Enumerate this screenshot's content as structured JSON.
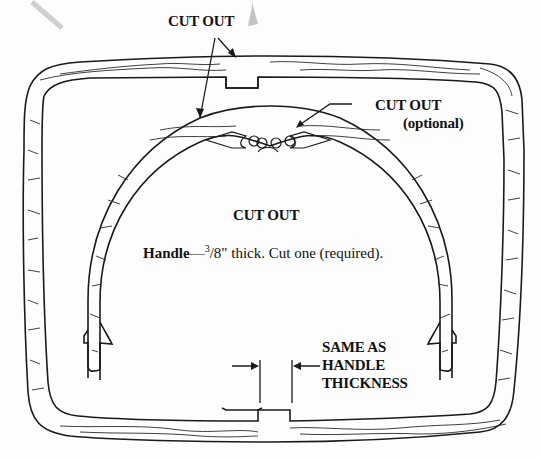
{
  "diagram": {
    "type": "woodworking-pattern",
    "labels": {
      "cutout_top": "CUT OUT",
      "cutout_optional_line1": "CUT OUT",
      "cutout_optional_line2": "(optional)",
      "cutout_center": "CUT OUT",
      "handle_name": "Handle",
      "handle_dash": "—",
      "handle_frac_num": "3",
      "handle_frac_den": "/8\"",
      "handle_desc": " thick. Cut one (required).",
      "same_as_line1": "SAME AS",
      "same_as_line2": "HANDLE",
      "same_as_line3": "THICKNESS"
    },
    "colors": {
      "line": "#1a1a1a",
      "grain": "#2a2a2a",
      "background": "#fdfdfd",
      "smudge": "#c8c8c8"
    }
  }
}
